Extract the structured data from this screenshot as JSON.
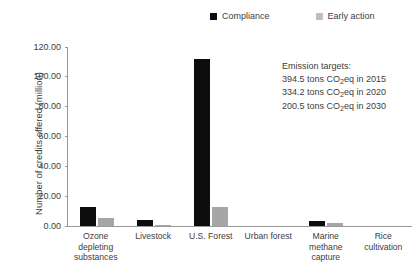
{
  "chart_data": {
    "type": "bar",
    "title": "",
    "xlabel": "",
    "ylabel": "Number of credits offered (million)",
    "ylim": [
      0,
      120
    ],
    "ytick_step": 20,
    "grid": false,
    "legend_position": "top-center",
    "categories": [
      "Ozone depleting substances",
      "Livestock",
      "U.S. Forest",
      "Urban forest",
      "Marine methane capture",
      "Rice cultivation"
    ],
    "series": [
      {
        "name": "Compliance",
        "color": "#0d0d0d",
        "values": [
          13.0,
          3.8,
          112.0,
          0.0,
          3.5,
          0.0
        ]
      },
      {
        "name": "Early action",
        "color": "#a6a6a6",
        "values": [
          5.5,
          0.8,
          12.5,
          0.0,
          2.0,
          0.0
        ]
      }
    ],
    "ytick_labels": [
      "0.00",
      "20.00",
      "40.00",
      "60.00",
      "80.00",
      "100.00",
      "120.00"
    ],
    "annotations": [
      "Emission targets:",
      "394.5 tons CO2eq in 2015",
      "334.2 tons CO2eq in 2020",
      "200.5 tons CO2eq in 2030"
    ]
  },
  "axes": {
    "y_title": "Number of credits offered (million)",
    "y_ticks": [
      {
        "value": 120,
        "label": "120.00"
      },
      {
        "value": 100,
        "label": "100.00"
      },
      {
        "value": 80,
        "label": "80.00"
      },
      {
        "value": 60,
        "label": "60.00"
      },
      {
        "value": 40,
        "label": "40.00"
      },
      {
        "value": 20,
        "label": "20.00"
      },
      {
        "value": 0,
        "label": "0.00"
      }
    ],
    "x_categories": [
      {
        "lines": [
          "Ozone",
          "depleting",
          "substances"
        ]
      },
      {
        "lines": [
          "Livestock"
        ]
      },
      {
        "lines": [
          "U.S. Forest"
        ]
      },
      {
        "lines": [
          "Urban forest"
        ]
      },
      {
        "lines": [
          "Marine",
          "methane",
          "capture"
        ]
      },
      {
        "lines": [
          "Rice",
          "cultivation"
        ]
      }
    ]
  },
  "legend": {
    "items": [
      {
        "label": "Compliance",
        "color": "#0d0d0d"
      },
      {
        "label": "Early action",
        "color": "#bfbfbf"
      }
    ]
  },
  "annotation": {
    "heading": "Emission targets:",
    "lines": [
      {
        "amount": "394.5 tons CO",
        "sub": "2",
        "tail": "eq in 2015"
      },
      {
        "amount": "334.2 tons CO",
        "sub": "2",
        "tail": "eq in 2020"
      },
      {
        "amount": "200.5 tons CO",
        "sub": "2",
        "tail": "eq in 2030"
      }
    ]
  }
}
